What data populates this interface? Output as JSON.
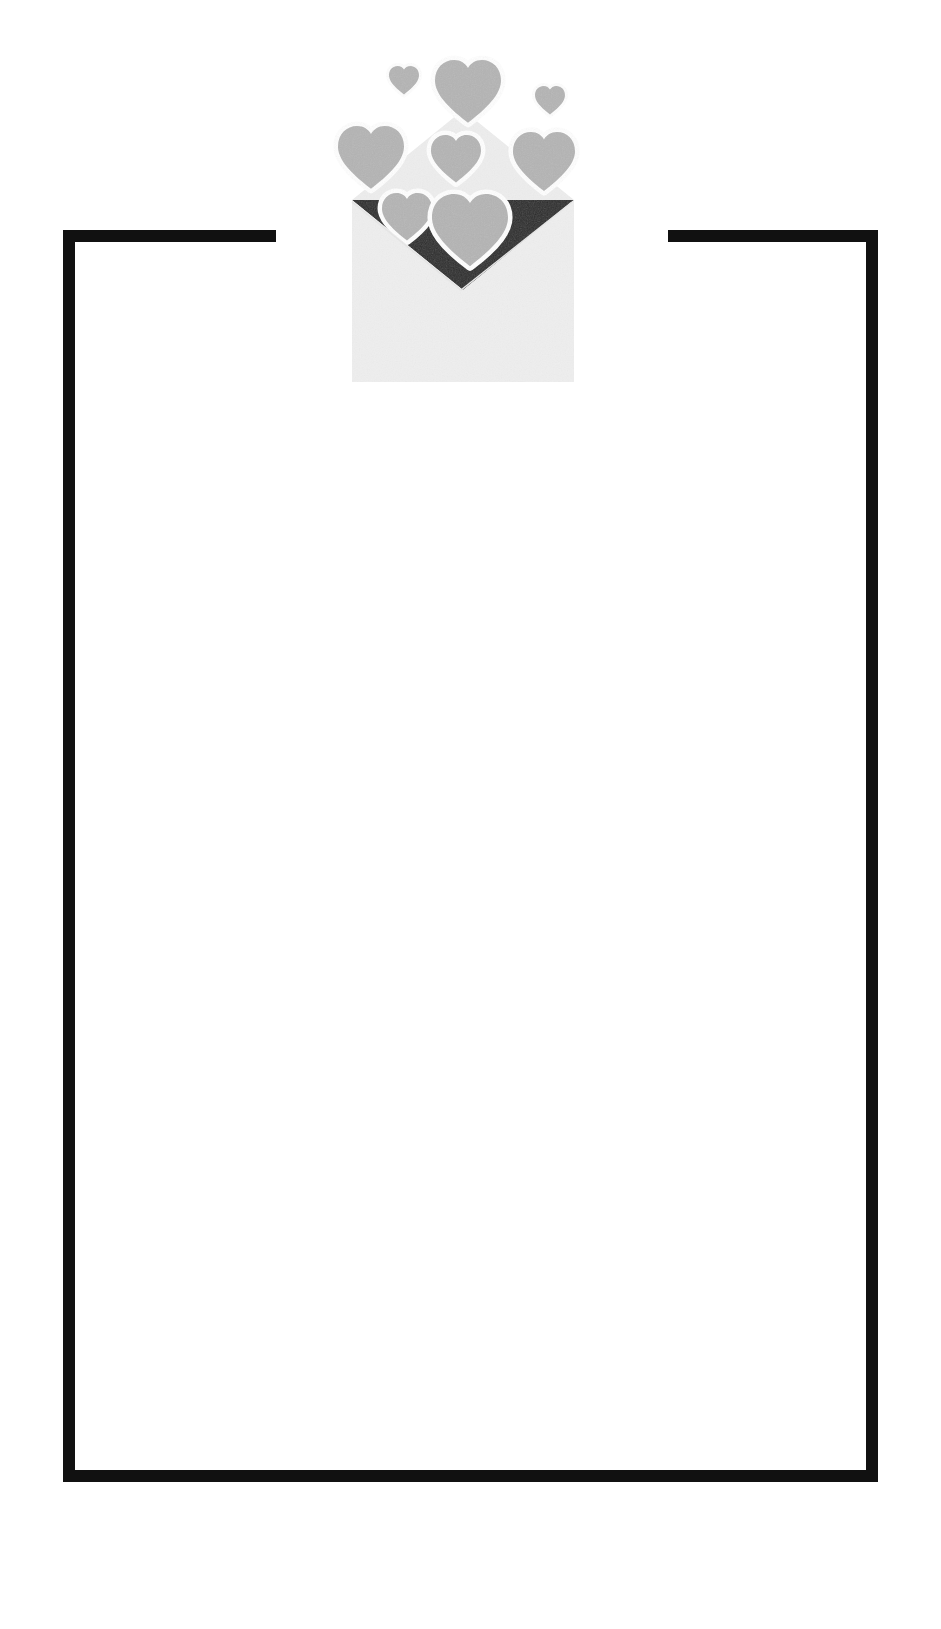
{
  "page": {
    "name": "valentine-love-letter-card-template",
    "width": 941,
    "height": 1629,
    "background_color": "#ffffff"
  },
  "frame": {
    "name": "card-border",
    "stroke_color": "#111111",
    "stroke_width": 12,
    "left": 63,
    "top": 230,
    "right": 878,
    "bottom": 1482,
    "gap": {
      "label": "top-centre-gap-for-envelope",
      "start_x": 276,
      "end_x": 668
    }
  },
  "interior": {
    "name": "blank-card-body",
    "background_color": "#ffffff",
    "text": ""
  },
  "envelope": {
    "name": "open-envelope-with-hearts",
    "body_color": "#eeeeee",
    "body_shade_color": "#e4e4e4",
    "flap_color": "#2b2b2b",
    "back_flap_color": "#ededed",
    "heart_color": "#b4b4b4",
    "heart_outline_color": "#ffffff",
    "left": 352,
    "right": 572,
    "top": 110,
    "bottom": 382,
    "heart_count": 8,
    "hearts": [
      {
        "id": "heart-float-small-left",
        "cx": 404,
        "cy": 80,
        "size": 30,
        "fill": "#b4b4b4"
      },
      {
        "id": "heart-float-large-center",
        "cx": 468,
        "cy": 92,
        "size": 66,
        "fill": "#b4b4b4"
      },
      {
        "id": "heart-float-small-right",
        "cx": 550,
        "cy": 101,
        "size": 30,
        "fill": "#b4b4b4"
      },
      {
        "id": "heart-outer-left",
        "cx": 371,
        "cy": 158,
        "size": 66,
        "fill": "#b4b4b4"
      },
      {
        "id": "heart-flap-center",
        "cx": 456,
        "cy": 159,
        "size": 50,
        "fill": "#b4b4b4"
      },
      {
        "id": "heart-outer-right",
        "cx": 544,
        "cy": 163,
        "size": 62,
        "fill": "#b4b4b4"
      },
      {
        "id": "heart-inner-left",
        "cx": 407,
        "cy": 218,
        "size": 50,
        "fill": "#b4b4b4"
      },
      {
        "id": "heart-inner-right",
        "cx": 470,
        "cy": 232,
        "size": 76,
        "fill": "#b4b4b4"
      }
    ]
  }
}
